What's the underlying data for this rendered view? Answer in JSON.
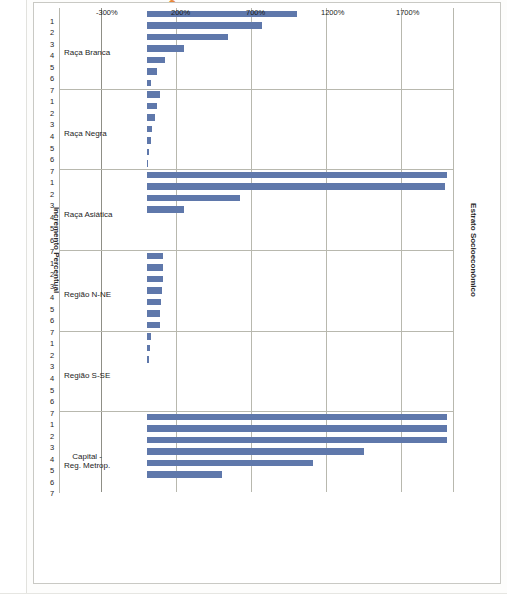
{
  "panel": {
    "title": "Painel A",
    "title_color": "#e8883a"
  },
  "chart_data": {
    "type": "bar",
    "orientation": "horizontal-on-page",
    "title": "Painel A",
    "xlabel": "Estrato Socioeconômico",
    "ylabel": "Incremento Percentual",
    "ylim": [
      -300,
      2050
    ],
    "ytick_labels": [
      "1700%",
      "1200%",
      "700%",
      "200%",
      "-300%"
    ],
    "ytick_values": [
      1700,
      1200,
      700,
      200,
      -300
    ],
    "grid": true,
    "legend": "none",
    "bar_color": "#5f78ab",
    "strata_labels": [
      "1",
      "2",
      "3",
      "4",
      "5",
      "6",
      "7"
    ],
    "groups": [
      {
        "label": "Raça Branca",
        "strata": [
          "1",
          "2",
          "3",
          "4",
          "5",
          "6",
          "7"
        ],
        "values": [
          1000,
          770,
          540,
          250,
          120,
          70,
          30
        ]
      },
      {
        "label": "Raça Negra",
        "strata": [
          "1",
          "2",
          "3",
          "4",
          "5",
          "6",
          "7"
        ],
        "values": [
          90,
          70,
          55,
          35,
          25,
          12,
          8
        ]
      },
      {
        "label": "Raça Asiática",
        "strata": [
          "1",
          "2",
          "3",
          "4",
          "5",
          "6",
          "7"
        ],
        "values": [
          2000,
          1990,
          620,
          250,
          0,
          0,
          0
        ]
      },
      {
        "label": "Região N-NE",
        "strata": [
          "1",
          "2",
          "3",
          "4",
          "5",
          "6",
          "7"
        ],
        "values": [
          110,
          110,
          105,
          100,
          95,
          90,
          85
        ]
      },
      {
        "label": "Região S-SE",
        "strata": [
          "1",
          "2",
          "3",
          "4",
          "5",
          "6",
          "7"
        ],
        "values": [
          25,
          20,
          12,
          0,
          0,
          0,
          0
        ]
      },
      {
        "label": "Capital - Reg. Metrop.",
        "strata": [
          "1",
          "2",
          "3",
          "4",
          "5",
          "6",
          "7"
        ],
        "values": [
          2000,
          2000,
          2000,
          1450,
          1110,
          500,
          0
        ]
      }
    ]
  }
}
